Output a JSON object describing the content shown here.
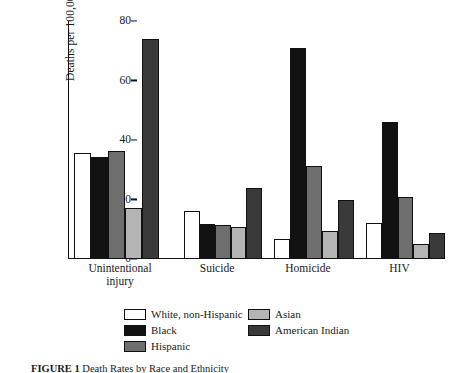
{
  "chart_data": {
    "type": "bar",
    "title": "",
    "xlabel": "",
    "ylabel": "Deaths per 100,000 persons",
    "ylim": [
      0,
      80
    ],
    "yticks": [
      0,
      20,
      40,
      60,
      80
    ],
    "grid": false,
    "legend_position": "bottom",
    "categories": [
      "Unintentional injury",
      "Suicide",
      "Homicide",
      "HIV"
    ],
    "series": [
      {
        "name": "White, non-Hispanic",
        "color": "#ffffff",
        "values": [
          35.5,
          16.2,
          6.8,
          12.0
        ]
      },
      {
        "name": "Black",
        "color": "#121212",
        "values": [
          34.3,
          11.7,
          70.8,
          46.2
        ]
      },
      {
        "name": "Hispanic",
        "color": "#6e6e6e",
        "values": [
          36.2,
          11.3,
          31.2,
          21.0
        ]
      },
      {
        "name": "Asian",
        "color": "#b4b4b4",
        "values": [
          17.0,
          10.7,
          9.4,
          5.0
        ]
      },
      {
        "name": "American Indian",
        "color": "#3a3a3a",
        "values": [
          73.8,
          24.0,
          19.7,
          8.7
        ]
      }
    ]
  },
  "axis": {
    "ylabel": "Deaths per 100,000 persons",
    "tick_80": "80",
    "tick_60": "60",
    "tick_40": "40",
    "tick_20": "20",
    "tick_0": "0"
  },
  "xlabels": {
    "c0_line1": "Unintentional",
    "c0_line2": "injury",
    "c1": "Suicide",
    "c2": "Homicide",
    "c3": "HIV"
  },
  "legend": {
    "items": [
      {
        "label": "White, non-Hispanic"
      },
      {
        "label": "Asian"
      },
      {
        "label": "Black"
      },
      {
        "label": "American Indian"
      },
      {
        "label": "Hispanic"
      }
    ]
  },
  "caption": {
    "prefix": "FIGURE 1",
    "text": "Death Rates by Race and Ethnicity"
  }
}
